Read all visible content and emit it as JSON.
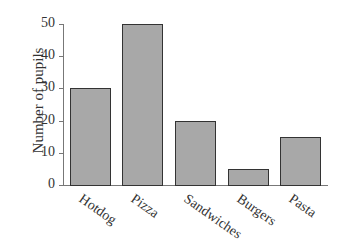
{
  "chart_data": {
    "type": "bar",
    "title": "",
    "xlabel": "",
    "ylabel": "Number of pupils",
    "categories": [
      "Hotdog",
      "Pizza",
      "Sandwiches",
      "Burgers",
      "Pasta"
    ],
    "values": [
      30,
      50,
      20,
      5,
      15
    ],
    "ylim": [
      0,
      50
    ],
    "yticks": [
      0,
      10,
      20,
      30,
      40,
      50
    ],
    "grid": false,
    "legend": null,
    "bar_color": "#a8a8a8",
    "edge_color": "#333333"
  }
}
